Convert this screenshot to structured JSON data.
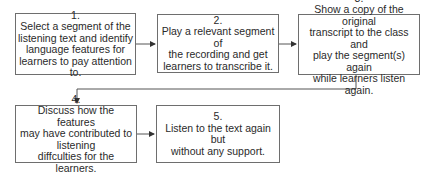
{
  "diagram": {
    "type": "flowchart",
    "steps": [
      {
        "num": "1.",
        "text": "Select a segment of the\nlistening text and identify\nlanguage features for\nlearners to pay attention to."
      },
      {
        "num": "2.",
        "text": "Play a relevant segment of\nthe recording and get\nlearners to transcribe it."
      },
      {
        "num": "3.",
        "text": "Show a copy of the original\ntranscript to the class and\nplay the segment(s) again\nwhile learners listen again."
      },
      {
        "num": "4.",
        "text": "Discuss how the features\nmay have contributed to\nlistening\ndiffculties for the learners."
      },
      {
        "num": "5.",
        "text": "Listen to the text again but\nwithout any support."
      }
    ],
    "connections": [
      {
        "from": "1",
        "to": "2"
      },
      {
        "from": "2",
        "to": "3"
      },
      {
        "from": "3",
        "to": "4"
      },
      {
        "from": "4",
        "to": "5"
      }
    ],
    "colors": {
      "border": "#6e6e6e",
      "text": "#2a2a2a",
      "line": "#555555"
    }
  }
}
